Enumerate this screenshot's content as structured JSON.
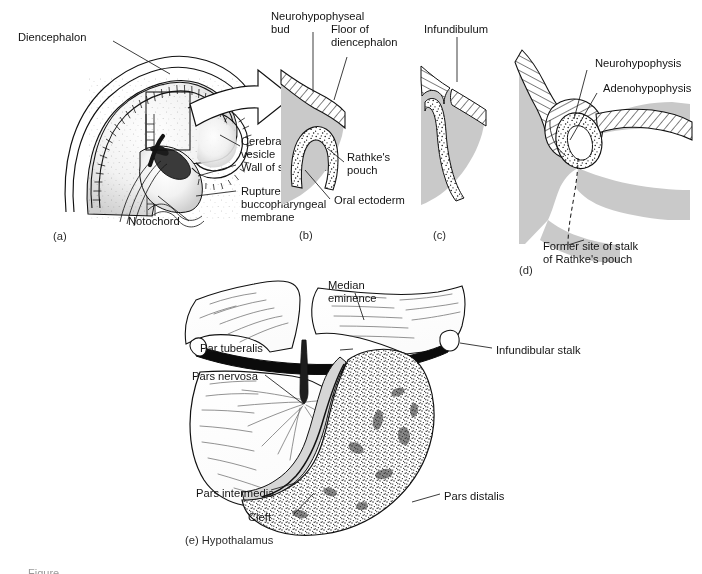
{
  "figure": {
    "title_partial": "Figure",
    "panels": [
      {
        "id": "a",
        "letter": "(a)",
        "labels": [
          "Diencephalon",
          "Cerebral vesicle",
          "Wall of stomodeum",
          "Ruptured buccopharyngeal membrane",
          "Notochord"
        ]
      },
      {
        "id": "b",
        "letter": "(b)",
        "labels": [
          "Neurohypophyseal bud",
          "Floor of diencephalon",
          "Rathke's pouch",
          "Oral ectoderm"
        ]
      },
      {
        "id": "c",
        "letter": "(c)",
        "labels": [
          "Infundibulum"
        ]
      },
      {
        "id": "d",
        "letter": "(d)",
        "labels": [
          "Neurohypophysis",
          "Adenohypophysis",
          "Former site of stalk of Rathke's pouch"
        ]
      },
      {
        "id": "e",
        "letter": "(e) Hypothalamus",
        "labels": [
          "Median eminence",
          "Infundibular stalk",
          "Par tuberalis",
          "Pars nervosa",
          "Pars intermedia",
          "Cleft",
          "Pars distalis"
        ]
      }
    ]
  },
  "panel_a": {
    "letter": "(a)",
    "label_diencephalon": "Diencephalon",
    "label_cerebral_vesicle_l1": "Cerebral",
    "label_cerebral_vesicle_l2": "vesicle",
    "label_wall_of_stomodeum": "Wall of stomodeum",
    "label_ruptured_l1": "Ruptured",
    "label_ruptured_l2": "buccopharyngeal",
    "label_ruptured_l3": "membrane",
    "label_notochord": "Notochord"
  },
  "panel_b": {
    "letter": "(b)",
    "label_neuro_bud_l1": "Neurohypophyseal",
    "label_neuro_bud_l2": "bud",
    "label_floor_l1": "Floor of",
    "label_floor_l2": "diencephalon",
    "label_rathke_l1": "Rathke's",
    "label_rathke_l2": "pouch",
    "label_oral_ectoderm": "Oral ectoderm"
  },
  "panel_c": {
    "letter": "(c)",
    "label_infundibulum": "Infundibulum"
  },
  "panel_d": {
    "letter": "(d)",
    "label_neurohypophysis": "Neurohypophysis",
    "label_adenohypophysis": "Adenohypophysis",
    "label_former_site_l1": "Former site of stalk",
    "label_former_site_l2": "of Rathke's pouch"
  },
  "panel_e": {
    "letter": "(e) Hypothalamus",
    "label_median_eminence_l1": "Median",
    "label_median_eminence_l2": "eminence",
    "label_infundibular_stalk": "Infundibular stalk",
    "label_par_tuberalis": "Par tuberalis",
    "label_pars_nervosa": "Pars nervosa",
    "label_pars_intermedia": "Pars intermedia",
    "label_cleft": "Cleft",
    "label_pars_distalis": "Pars distalis"
  },
  "colors": {
    "ink": "#111111",
    "tissue_gray": "#c9c9c9",
    "band_black": "#0b0b0b",
    "paper": "#ffffff"
  }
}
